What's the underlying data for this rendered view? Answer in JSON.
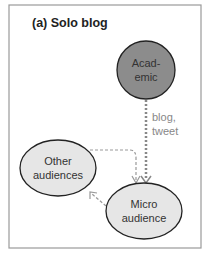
{
  "title": "(a) Solo blog",
  "nodes": {
    "academic": {
      "line1": "Acad-",
      "line2": "emic",
      "fill": "#8c8c8c"
    },
    "other": {
      "line1": "Other",
      "line2": "audiences",
      "fill": "#e6e6e6"
    },
    "micro": {
      "line1": "Micro",
      "line2": "audience",
      "fill": "#e6e6e6"
    }
  },
  "edges": {
    "academic_to_micro": {
      "line1": "blog,",
      "line2": "tweet"
    }
  },
  "colors": {
    "border": "#9a9a9a",
    "arrow_dark": "#888888",
    "arrow_light": "#a0a0a0"
  }
}
